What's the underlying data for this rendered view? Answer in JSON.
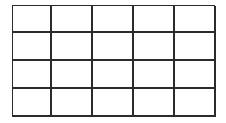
{
  "grid": {
    "columns": 5,
    "rows": 4,
    "line_color": "#2b2b2b",
    "cells": [
      [
        "",
        "",
        "",
        "",
        ""
      ],
      [
        "",
        "",
        "",
        "",
        ""
      ],
      [
        "",
        "",
        "",
        "",
        ""
      ],
      [
        "",
        "",
        "",
        "",
        ""
      ]
    ]
  }
}
